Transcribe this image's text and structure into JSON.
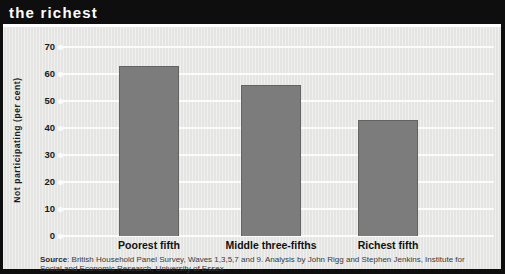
{
  "header": {
    "title": "the richest"
  },
  "source": {
    "label": "Source",
    "text": ": British Household Panel Survey, Waves 1,3,5,7 and 9. Analysis by John Rigg and Stephen Jenkins, Institute for Social and Economic Research, University of Essex"
  },
  "chart_data": {
    "type": "bar",
    "title": "the richest",
    "categories": [
      "Poorest fifth",
      "Middle three-fifths",
      "Richest fifth"
    ],
    "values": [
      63,
      56,
      43
    ],
    "xlabel": "",
    "ylabel": "Not participating (per cent)",
    "ylim": [
      0,
      70
    ],
    "ytick_step": 10,
    "grid": true,
    "legend": "none",
    "bar_color": "#7c7c7c",
    "panel_background": "#e8e8e6",
    "header_background": "#0e0e0e",
    "gridline_color": "#fcfcfc"
  }
}
